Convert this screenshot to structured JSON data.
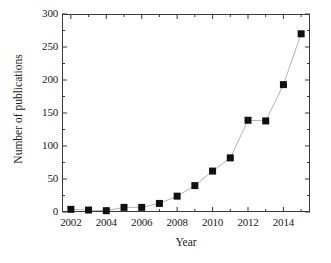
{
  "chart_data": {
    "type": "line",
    "title": "",
    "subtitle": "",
    "xlabel": "Year",
    "ylabel": "Number of publications",
    "x": [
      2002,
      2003,
      2004,
      2005,
      2006,
      2007,
      2008,
      2009,
      2010,
      2011,
      2012,
      2013,
      2014,
      2015
    ],
    "values": [
      4,
      3,
      2,
      7,
      7,
      13,
      24,
      40,
      62,
      82,
      139,
      138,
      193,
      270
    ],
    "series": [
      {
        "name": "Number of publications",
        "values": [
          4,
          3,
          2,
          7,
          7,
          13,
          24,
          40,
          62,
          82,
          139,
          138,
          193,
          270
        ]
      }
    ],
    "xlim": [
      2001.5,
      2015.5
    ],
    "ylim": [
      0,
      300
    ],
    "xticks": [
      2002,
      2004,
      2006,
      2008,
      2010,
      2012,
      2014
    ],
    "xtick_labels": [
      "2002",
      "2004",
      "2006",
      "2008",
      "2010",
      "2012",
      "2014"
    ],
    "x_minor_ticks": [
      2003,
      2005,
      2007,
      2009,
      2011,
      2013,
      2015
    ],
    "yticks": [
      0,
      50,
      100,
      150,
      200,
      250,
      300
    ],
    "ytick_labels": [
      "0",
      "50",
      "100",
      "150",
      "200",
      "250",
      "300"
    ],
    "y_minor_ticks": [
      25,
      75,
      125,
      175,
      225,
      275
    ],
    "grid": false,
    "legend": false,
    "legend_position": "none",
    "marker": "filled-square",
    "marker_color": "#111111",
    "line_color": "#b4b4b4",
    "axis_color": "#3a3a3a",
    "background_color": "#ffffff"
  }
}
